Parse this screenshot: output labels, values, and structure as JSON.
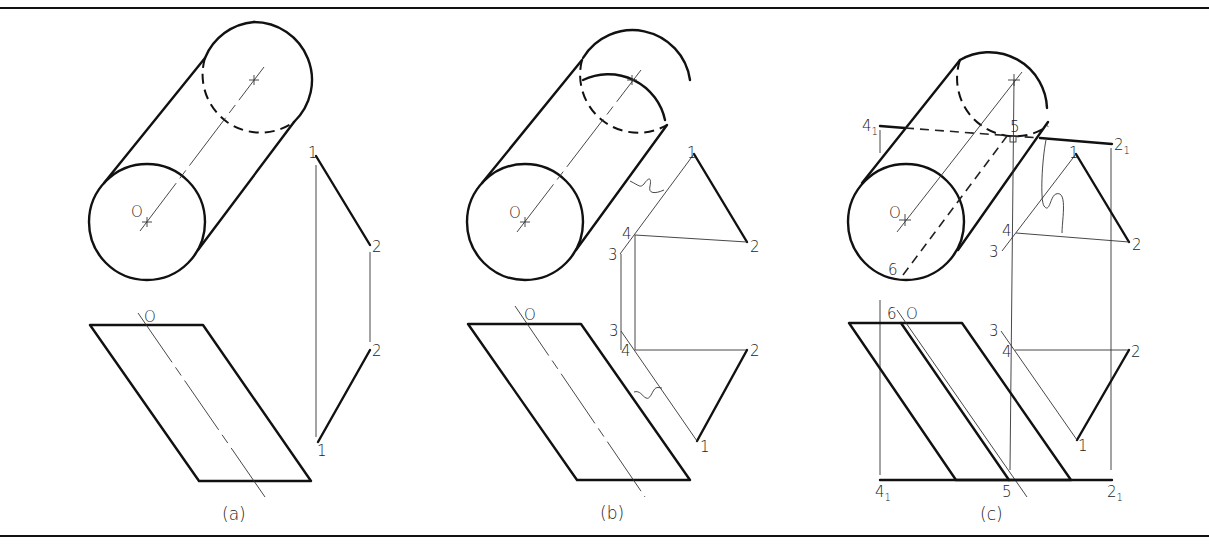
{
  "figure": {
    "panels": [
      {
        "id": "a",
        "caption": "(a)",
        "labels": {
          "center": "O",
          "center_bottom": "O",
          "p1_top": "1",
          "p2_top": "2",
          "p2_bottom": "2",
          "p1_bottom": "1"
        }
      },
      {
        "id": "b",
        "caption": "(b)",
        "labels": {
          "center": "O",
          "center_bottom": "O",
          "p1_top": "1",
          "p2_top": "2",
          "p3_top": "3",
          "p4_top": "4",
          "p3_bottom": "3",
          "p4_bottom": "4",
          "p2_bottom": "2",
          "p1_bottom": "1"
        }
      },
      {
        "id": "c",
        "caption": "(c)",
        "labels": {
          "center": "O",
          "center_bottom": "O",
          "p1_top": "1",
          "p2_top": "2",
          "p3_top": "3",
          "p4_top": "4",
          "p41_top": "4",
          "p21_top": "2",
          "p5_top": "5",
          "p6_top": "6",
          "p6_bottom": "6",
          "p3_bottom": "3",
          "p4_bottom": "4",
          "p2_bottom": "2",
          "p1_bottom": "1",
          "p41_bottom": "4",
          "p5_bottom": "5",
          "p21_bottom": "2",
          "subscript": "1"
        }
      }
    ],
    "colors": {
      "line": "#111111",
      "background": "#ffffff"
    }
  }
}
